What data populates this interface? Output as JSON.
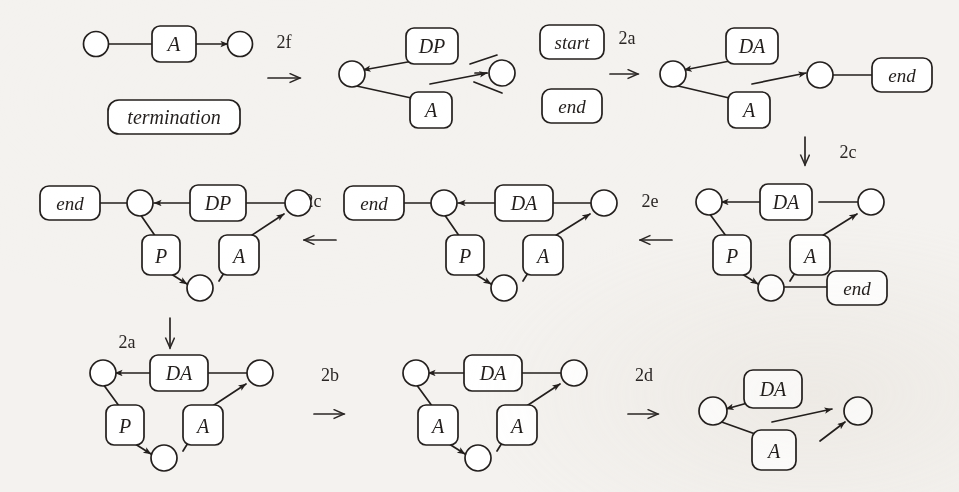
{
  "figure": {
    "kind": "graph-rewriting-derivation",
    "background_color": "#f4f2ef",
    "ink_color": "#231f1d",
    "node_fill": "#ffffff",
    "box_fill": "#ffffff"
  },
  "graphs": [
    {
      "id": "g1",
      "name": "graph-1-termination",
      "nodes": [
        {
          "id": "n1",
          "label": ""
        },
        {
          "id": "n2",
          "label": ""
        }
      ],
      "boxes": [
        {
          "id": "b1",
          "label": "A",
          "italic": true
        },
        {
          "id": "b2",
          "label": "termination",
          "italic": true
        }
      ],
      "edges": [
        {
          "from": "n1",
          "to": "b1",
          "arrow": false
        },
        {
          "from": "b1",
          "to": "n2",
          "arrow": true
        }
      ]
    },
    {
      "id": "g2",
      "name": "graph-2",
      "nodes": [
        {
          "id": "nL",
          "label": ""
        },
        {
          "id": "nR",
          "label": ""
        }
      ],
      "boxes": [
        {
          "id": "bDP",
          "label": "DP",
          "italic": true
        },
        {
          "id": "bA",
          "label": "A",
          "italic": true
        },
        {
          "id": "bStart",
          "label": "start",
          "italic": true
        },
        {
          "id": "bEnd",
          "label": "end",
          "italic": true
        }
      ]
    },
    {
      "id": "g3",
      "name": "graph-3",
      "nodes": [
        {
          "id": "nL",
          "label": ""
        },
        {
          "id": "nR",
          "label": ""
        }
      ],
      "boxes": [
        {
          "id": "bDA",
          "label": "DA",
          "italic": true
        },
        {
          "id": "bA",
          "label": "A",
          "italic": true
        },
        {
          "id": "bEnd",
          "label": "end",
          "italic": true
        }
      ]
    },
    {
      "id": "g4",
      "name": "graph-4",
      "nodes": [
        {
          "id": "nTL",
          "label": ""
        },
        {
          "id": "nTR",
          "label": ""
        },
        {
          "id": "nB",
          "label": ""
        }
      ],
      "boxes": [
        {
          "id": "bDA",
          "label": "DA",
          "italic": true
        },
        {
          "id": "bP",
          "label": "P",
          "italic": true
        },
        {
          "id": "bA",
          "label": "A",
          "italic": true
        },
        {
          "id": "bEnd",
          "label": "end",
          "italic": true
        }
      ]
    },
    {
      "id": "g5",
      "name": "graph-5",
      "nodes": [
        {
          "id": "nTL",
          "label": ""
        },
        {
          "id": "nTR",
          "label": ""
        },
        {
          "id": "nB",
          "label": ""
        }
      ],
      "boxes": [
        {
          "id": "bEnd",
          "label": "end",
          "italic": true
        },
        {
          "id": "bDA",
          "label": "DA",
          "italic": true
        },
        {
          "id": "bP",
          "label": "P",
          "italic": true
        },
        {
          "id": "bA",
          "label": "A",
          "italic": true
        }
      ]
    },
    {
      "id": "g6",
      "name": "graph-6",
      "nodes": [
        {
          "id": "nTL",
          "label": ""
        },
        {
          "id": "nTR",
          "label": ""
        },
        {
          "id": "nB",
          "label": ""
        }
      ],
      "boxes": [
        {
          "id": "bEnd",
          "label": "end",
          "italic": true
        },
        {
          "id": "bDP",
          "label": "DP",
          "italic": true
        },
        {
          "id": "bP",
          "label": "P",
          "italic": true
        },
        {
          "id": "bA",
          "label": "A",
          "italic": true
        }
      ]
    },
    {
      "id": "g7",
      "name": "graph-7",
      "nodes": [
        {
          "id": "nTL",
          "label": ""
        },
        {
          "id": "nTR",
          "label": ""
        },
        {
          "id": "nB",
          "label": ""
        }
      ],
      "boxes": [
        {
          "id": "bDA",
          "label": "DA",
          "italic": true
        },
        {
          "id": "bP",
          "label": "P",
          "italic": true
        },
        {
          "id": "bA",
          "label": "A",
          "italic": true
        }
      ]
    },
    {
      "id": "g8",
      "name": "graph-8",
      "nodes": [
        {
          "id": "nTL",
          "label": ""
        },
        {
          "id": "nTR",
          "label": ""
        },
        {
          "id": "nB",
          "label": ""
        }
      ],
      "boxes": [
        {
          "id": "bDA",
          "label": "DA",
          "italic": true
        },
        {
          "id": "bA1",
          "label": "A",
          "italic": true
        },
        {
          "id": "bA2",
          "label": "A",
          "italic": true
        }
      ]
    },
    {
      "id": "g9",
      "name": "graph-9",
      "nodes": [
        {
          "id": "nL",
          "label": ""
        },
        {
          "id": "nR",
          "label": ""
        }
      ],
      "boxes": [
        {
          "id": "bDA",
          "label": "DA",
          "italic": true
        },
        {
          "id": "bA",
          "label": "A",
          "italic": true
        }
      ]
    }
  ],
  "labels": {
    "g1_A": "A",
    "g1_termination": "termination",
    "g2_DP": "DP",
    "g2_A": "A",
    "g2_start": "start",
    "g2_end": "end",
    "g3_DA": "DA",
    "g3_A": "A",
    "g3_end": "end",
    "g4_DA": "DA",
    "g4_P": "P",
    "g4_A": "A",
    "g4_end": "end",
    "g5_end": "end",
    "g5_DA": "DA",
    "g5_P": "P",
    "g5_A": "A",
    "g6_end": "end",
    "g6_DP": "DP",
    "g6_P": "P",
    "g6_A": "A",
    "g7_DA": "DA",
    "g7_P": "P",
    "g7_A": "A",
    "g8_DA": "DA",
    "g8_A1": "A",
    "g8_A2": "A",
    "g9_DA": "DA",
    "g9_A": "A"
  },
  "transitions": [
    {
      "id": "t1",
      "label": "2f",
      "direction": "right",
      "from": "g1",
      "to": "g2"
    },
    {
      "id": "t2",
      "label": "2a",
      "direction": "right",
      "from": "g2",
      "to": "g3"
    },
    {
      "id": "t3",
      "label": "2c",
      "direction": "down",
      "from": "g3",
      "to": "g4"
    },
    {
      "id": "t4",
      "label": "2e",
      "direction": "left",
      "from": "g4",
      "to": "g5"
    },
    {
      "id": "t5",
      "label": "2c",
      "direction": "left",
      "from": "g5",
      "to": "g6"
    },
    {
      "id": "t6",
      "label": "2a",
      "direction": "down",
      "from": "g6",
      "to": "g7"
    },
    {
      "id": "t7",
      "label": "2b",
      "direction": "right",
      "from": "g7",
      "to": "g8"
    },
    {
      "id": "t8",
      "label": "2d",
      "direction": "right",
      "from": "g8",
      "to": "g9"
    }
  ]
}
